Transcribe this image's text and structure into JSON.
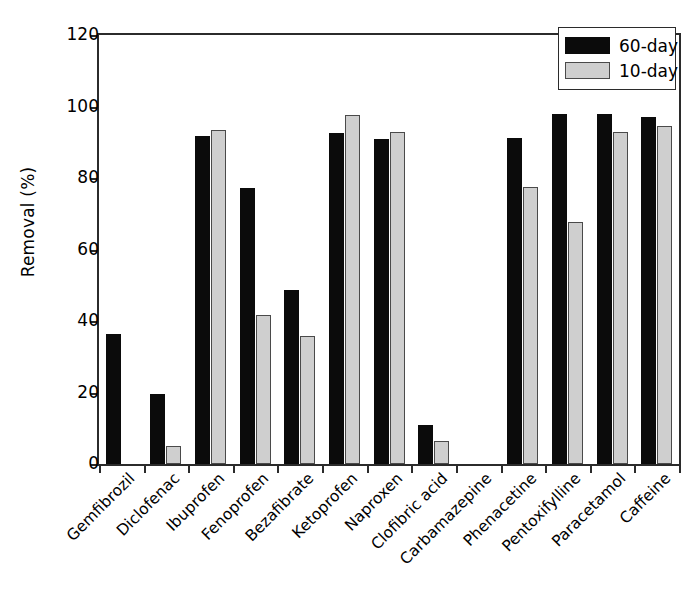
{
  "chart_data": {
    "type": "bar",
    "title": "",
    "xlabel": "",
    "ylabel": "Removal (%)",
    "ylim": [
      0,
      120
    ],
    "yticks": [
      0,
      20,
      40,
      60,
      80,
      100,
      120
    ],
    "grid": false,
    "legend_position": "top-right",
    "categories": [
      "Gemfibrozil",
      "Diclofenac",
      "Ibuprofen",
      "Fenoprofen",
      "Bezafibrate",
      "Ketoprofen",
      "Naproxen",
      "Clofibric acid",
      "Carbamazepine",
      "Phenacetine",
      "Pentoxifylline",
      "Paracetamol",
      "Caffeine"
    ],
    "series": [
      {
        "name": "60-day",
        "color": "#0b0b0b",
        "values": [
          36.5,
          19.6,
          91.8,
          77.3,
          48.7,
          92.7,
          90.8,
          10.9,
          0,
          91.1,
          97.9,
          97.9,
          97.2
        ]
      },
      {
        "name": "10-day",
        "color": "#cfcfcf",
        "values": [
          0,
          5.0,
          93.5,
          41.7,
          35.9,
          97.5,
          92.9,
          6.4,
          0,
          77.5,
          67.7,
          92.8,
          94.6
        ]
      }
    ]
  },
  "legend": {
    "entries": [
      {
        "label": "60-day",
        "swatch": "black-swatch"
      },
      {
        "label": "10-day",
        "swatch": "gray-swatch"
      }
    ]
  },
  "axes": {
    "y_title": "Removal (%)",
    "y_tick_labels": [
      "0",
      "20",
      "40",
      "60",
      "80",
      "100",
      "120"
    ]
  }
}
